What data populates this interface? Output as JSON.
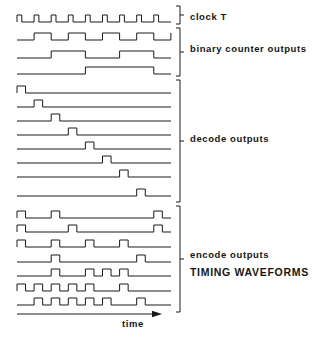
{
  "figure": {
    "title": "TIMING WAVEFORMS",
    "axis": {
      "x_label": "time",
      "arrow": "right-arrow"
    },
    "geometry": {
      "plot_left": 17,
      "plot_right": 171,
      "bracket_x": 180,
      "clock_period": 17.1,
      "pulse_high": 7,
      "row_gap": 13
    }
  },
  "groups": [
    {
      "id": "clock",
      "label": "clock   T",
      "bracket": {
        "top": 6,
        "bottom": 24
      },
      "rows": [
        {
          "name": "clock-waveform",
          "y": 22,
          "type": "pulse-train",
          "idle": "low",
          "pulses": [
            0,
            1,
            2,
            3,
            4,
            5,
            6,
            7,
            8
          ],
          "pulse_width": 0.28
        }
      ]
    },
    {
      "id": "binary-counter",
      "label": "binary  counter  outputs",
      "bracket": {
        "top": 28,
        "bottom": 76
      },
      "rows": [
        {
          "name": "counter-bit-q1",
          "y": 40,
          "type": "square",
          "divide": 2,
          "start": "low"
        },
        {
          "name": "counter-bit-q2",
          "y": 58,
          "type": "square",
          "divide": 4,
          "start": "low"
        },
        {
          "name": "counter-bit-q3",
          "y": 74,
          "type": "square",
          "divide": 8,
          "start": "low"
        }
      ]
    },
    {
      "id": "decode",
      "label": "decode  outputs",
      "bracket": {
        "top": 80,
        "bottom": 202
      },
      "rows": [
        {
          "name": "decode-out-0",
          "y": 93,
          "type": "step-pulse",
          "slot": 0
        },
        {
          "name": "decode-out-1",
          "y": 107,
          "type": "step-pulse",
          "slot": 1
        },
        {
          "name": "decode-out-2",
          "y": 121,
          "type": "step-pulse",
          "slot": 2
        },
        {
          "name": "decode-out-3",
          "y": 135,
          "type": "step-pulse",
          "slot": 3
        },
        {
          "name": "decode-out-4",
          "y": 149,
          "type": "step-pulse",
          "slot": 4
        },
        {
          "name": "decode-out-5",
          "y": 163,
          "type": "step-pulse",
          "slot": 5
        },
        {
          "name": "decode-out-6",
          "y": 177,
          "type": "step-pulse",
          "slot": 6
        },
        {
          "name": "decode-out-7",
          "y": 196,
          "type": "step-pulse",
          "slot": 7
        }
      ]
    },
    {
      "id": "encode",
      "label": "encode  outputs",
      "bracket": {
        "top": 206,
        "bottom": 312
      },
      "rows": [
        {
          "name": "encode-out-0",
          "y": 218,
          "type": "multi-pulse",
          "pulses": [
            0,
            2,
            8
          ]
        },
        {
          "name": "encode-out-1",
          "y": 232,
          "type": "multi-pulse",
          "pulses": [
            0,
            3,
            8
          ]
        },
        {
          "name": "encode-out-2",
          "y": 247,
          "type": "multi-pulse",
          "pulses": [
            0,
            2,
            4,
            6
          ]
        },
        {
          "name": "encode-out-3",
          "y": 262,
          "type": "multi-pulse",
          "pulses": [
            2,
            7
          ]
        },
        {
          "name": "encode-out-4",
          "y": 276,
          "type": "multi-pulse",
          "pulses": [
            2,
            4,
            5,
            6
          ]
        },
        {
          "name": "encode-out-5",
          "y": 291,
          "type": "multi-pulse",
          "pulses": [
            0,
            1,
            2,
            3,
            4,
            6
          ]
        },
        {
          "name": "encode-out-6",
          "y": 305,
          "type": "multi-pulse",
          "pulses": [
            1,
            2,
            3,
            4,
            5,
            7
          ]
        }
      ]
    }
  ],
  "colors": {
    "line": "#1a1a1a",
    "text": "#151515",
    "background": "#ffffff"
  }
}
